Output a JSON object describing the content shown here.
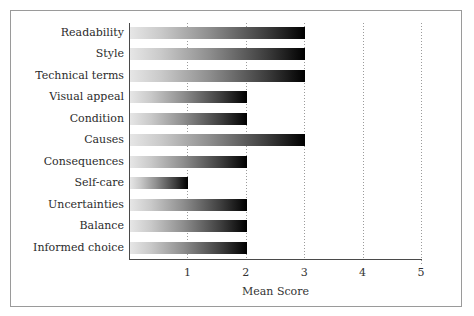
{
  "figure": {
    "caption_fragment": "·",
    "frame_color": "#9a9a9a",
    "background": "#ffffff"
  },
  "chart_data": {
    "type": "bar",
    "orientation": "horizontal",
    "title": "",
    "xlabel": "Mean Score",
    "ylabel": "",
    "xlim": [
      0,
      5
    ],
    "xticks": [
      1,
      2,
      3,
      4,
      5
    ],
    "xtick_labels": [
      "1",
      "2",
      "3",
      "4",
      "5"
    ],
    "grid": "vertical-dotted",
    "legend": "none",
    "bar_gradient": {
      "from": "#e6e6e6",
      "to": "#000000",
      "direction": "left-to-right"
    },
    "categories": [
      "Readability",
      "Style",
      "Technical terms",
      "Visual appeal",
      "Condition",
      "Causes",
      "Consequences",
      "Self-care",
      "Uncertainties",
      "Balance",
      "Informed choice"
    ],
    "values": [
      3,
      3,
      3,
      2,
      2,
      3,
      2,
      1,
      2,
      2,
      2
    ]
  }
}
